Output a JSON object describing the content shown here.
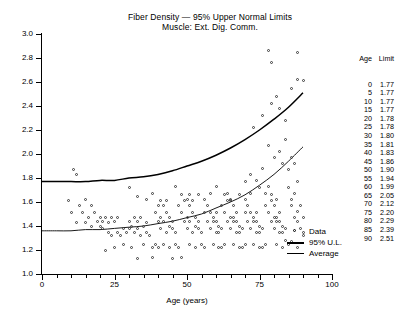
{
  "chart_data": {
    "type": "scatter",
    "title": "Fiber Density — 95% Upper Normal Limits",
    "subtitle": "Muscle: Ext. Dig. Comm.",
    "xlabel": "Age (years)",
    "ylabel": "",
    "xlim": [
      0,
      100
    ],
    "ylim": [
      1.0,
      3.0
    ],
    "xticks": [
      0,
      25,
      50,
      75,
      100
    ],
    "xtick_minor_step": 5,
    "yticks": [
      1.0,
      1.2,
      1.4,
      1.6,
      1.8,
      2.0,
      2.2,
      2.4,
      2.6,
      2.8,
      3.0
    ],
    "grid": false,
    "legend_position": "inside-bottom-right",
    "legend": [
      {
        "label": "Data",
        "marker": "open-circle"
      },
      {
        "label": "95% U.L.",
        "marker": "thick-line"
      },
      {
        "label": "Average",
        "marker": "thin-line"
      }
    ],
    "series": [
      {
        "name": "95% U.L.",
        "type": "line",
        "x": [
          0,
          5,
          10,
          15,
          20,
          25,
          30,
          35,
          40,
          45,
          50,
          55,
          60,
          65,
          70,
          75,
          80,
          85,
          90
        ],
        "values": [
          1.77,
          1.77,
          1.77,
          1.77,
          1.78,
          1.78,
          1.8,
          1.81,
          1.83,
          1.86,
          1.9,
          1.94,
          1.99,
          2.05,
          2.12,
          2.2,
          2.29,
          2.39,
          2.51
        ]
      },
      {
        "name": "Average",
        "type": "line",
        "x": [
          0,
          5,
          10,
          15,
          20,
          25,
          30,
          35,
          40,
          45,
          50,
          55,
          60,
          65,
          70,
          75,
          80,
          85,
          90
        ],
        "values": [
          1.36,
          1.36,
          1.36,
          1.37,
          1.37,
          1.38,
          1.39,
          1.4,
          1.42,
          1.44,
          1.47,
          1.5,
          1.55,
          1.6,
          1.66,
          1.74,
          1.83,
          1.94,
          2.06
        ]
      },
      {
        "name": "Data",
        "type": "scatter",
        "points": [
          [
            11,
            1.87
          ],
          [
            12,
            1.83
          ],
          [
            9,
            1.61
          ],
          [
            13,
            1.57
          ],
          [
            15,
            1.62
          ],
          [
            17,
            1.57
          ],
          [
            10,
            1.51
          ],
          [
            14,
            1.51
          ],
          [
            18,
            1.51
          ],
          [
            20,
            1.47
          ],
          [
            16,
            1.47
          ],
          [
            19,
            1.44
          ],
          [
            21,
            1.44
          ],
          [
            22,
            1.47
          ],
          [
            12,
            1.43
          ],
          [
            15,
            1.43
          ],
          [
            17,
            1.4
          ],
          [
            20,
            1.4
          ],
          [
            23,
            1.43
          ],
          [
            24,
            1.47
          ],
          [
            25,
            1.44
          ],
          [
            26,
            1.47
          ],
          [
            21,
            1.38
          ],
          [
            23,
            1.35
          ],
          [
            26,
            1.35
          ],
          [
            28,
            1.38
          ],
          [
            24,
            1.32
          ],
          [
            27,
            1.32
          ],
          [
            29,
            1.35
          ],
          [
            30,
            1.38
          ],
          [
            22,
            1.2
          ],
          [
            25,
            1.22
          ],
          [
            28,
            1.25
          ],
          [
            31,
            1.22
          ],
          [
            30,
            1.44
          ],
          [
            32,
            1.47
          ],
          [
            33,
            1.44
          ],
          [
            34,
            1.47
          ],
          [
            31,
            1.4
          ],
          [
            33,
            1.38
          ],
          [
            35,
            1.4
          ],
          [
            36,
            1.43
          ],
          [
            32,
            1.35
          ],
          [
            34,
            1.32
          ],
          [
            36,
            1.35
          ],
          [
            37,
            1.32
          ],
          [
            35,
            1.25
          ],
          [
            38,
            1.22
          ],
          [
            39,
            1.25
          ],
          [
            40,
            1.22
          ],
          [
            33,
            1.13
          ],
          [
            38,
            1.14
          ],
          [
            30,
            1.72
          ],
          [
            33,
            1.65
          ],
          [
            36,
            1.62
          ],
          [
            38,
            1.67
          ],
          [
            40,
            1.57
          ],
          [
            41,
            1.61
          ],
          [
            42,
            1.57
          ],
          [
            43,
            1.61
          ],
          [
            39,
            1.51
          ],
          [
            41,
            1.47
          ],
          [
            43,
            1.51
          ],
          [
            44,
            1.47
          ],
          [
            40,
            1.44
          ],
          [
            42,
            1.44
          ],
          [
            44,
            1.4
          ],
          [
            45,
            1.44
          ],
          [
            41,
            1.38
          ],
          [
            43,
            1.35
          ],
          [
            45,
            1.38
          ],
          [
            46,
            1.35
          ],
          [
            42,
            1.25
          ],
          [
            44,
            1.22
          ],
          [
            46,
            1.25
          ],
          [
            47,
            1.22
          ],
          [
            45,
            1.13
          ],
          [
            48,
            1.14
          ],
          [
            46,
            1.73
          ],
          [
            48,
            1.66
          ],
          [
            50,
            1.62
          ],
          [
            51,
            1.66
          ],
          [
            47,
            1.57
          ],
          [
            49,
            1.61
          ],
          [
            51,
            1.57
          ],
          [
            52,
            1.61
          ],
          [
            48,
            1.51
          ],
          [
            50,
            1.47
          ],
          [
            52,
            1.51
          ],
          [
            53,
            1.47
          ],
          [
            49,
            1.44
          ],
          [
            51,
            1.44
          ],
          [
            53,
            1.4
          ],
          [
            54,
            1.44
          ],
          [
            50,
            1.38
          ],
          [
            52,
            1.35
          ],
          [
            54,
            1.38
          ],
          [
            55,
            1.35
          ],
          [
            51,
            1.25
          ],
          [
            53,
            1.22
          ],
          [
            55,
            1.25
          ],
          [
            56,
            1.22
          ],
          [
            54,
            1.66
          ],
          [
            56,
            1.62
          ],
          [
            58,
            1.67
          ],
          [
            57,
            1.57
          ],
          [
            56,
            1.51
          ],
          [
            58,
            1.51
          ],
          [
            59,
            1.47
          ],
          [
            60,
            1.51
          ],
          [
            57,
            1.44
          ],
          [
            59,
            1.44
          ],
          [
            61,
            1.4
          ],
          [
            60,
            1.44
          ],
          [
            58,
            1.38
          ],
          [
            60,
            1.35
          ],
          [
            62,
            1.38
          ],
          [
            61,
            1.35
          ],
          [
            59,
            1.25
          ],
          [
            61,
            1.22
          ],
          [
            63,
            1.25
          ],
          [
            62,
            1.22
          ],
          [
            60,
            1.73
          ],
          [
            63,
            1.66
          ],
          [
            65,
            1.62
          ],
          [
            64,
            1.67
          ],
          [
            62,
            1.57
          ],
          [
            64,
            1.61
          ],
          [
            66,
            1.57
          ],
          [
            65,
            1.61
          ],
          [
            63,
            1.51
          ],
          [
            65,
            1.47
          ],
          [
            67,
            1.51
          ],
          [
            66,
            1.47
          ],
          [
            64,
            1.44
          ],
          [
            66,
            1.44
          ],
          [
            68,
            1.4
          ],
          [
            67,
            1.44
          ],
          [
            65,
            1.38
          ],
          [
            67,
            1.35
          ],
          [
            69,
            1.38
          ],
          [
            68,
            1.35
          ],
          [
            66,
            1.25
          ],
          [
            68,
            1.22
          ],
          [
            70,
            1.25
          ],
          [
            69,
            1.22
          ],
          [
            68,
            1.66
          ],
          [
            70,
            1.62
          ],
          [
            72,
            1.67
          ],
          [
            71,
            1.57
          ],
          [
            70,
            1.51
          ],
          [
            72,
            1.51
          ],
          [
            73,
            1.47
          ],
          [
            74,
            1.51
          ],
          [
            71,
            1.44
          ],
          [
            73,
            1.44
          ],
          [
            75,
            1.4
          ],
          [
            74,
            1.44
          ],
          [
            72,
            1.38
          ],
          [
            74,
            1.35
          ],
          [
            76,
            1.38
          ],
          [
            75,
            1.35
          ],
          [
            73,
            1.25
          ],
          [
            75,
            1.22
          ],
          [
            77,
            1.25
          ],
          [
            76,
            1.22
          ],
          [
            70,
            1.77
          ],
          [
            72,
            1.83
          ],
          [
            74,
            1.78
          ],
          [
            76,
            1.88
          ],
          [
            75,
            1.72
          ],
          [
            77,
            1.67
          ],
          [
            78,
            1.73
          ],
          [
            79,
            1.66
          ],
          [
            77,
            1.57
          ],
          [
            79,
            1.61
          ],
          [
            80,
            1.57
          ],
          [
            81,
            1.62
          ],
          [
            78,
            1.51
          ],
          [
            80,
            1.47
          ],
          [
            82,
            1.51
          ],
          [
            81,
            1.47
          ],
          [
            79,
            1.44
          ],
          [
            81,
            1.44
          ],
          [
            83,
            1.4
          ],
          [
            82,
            1.44
          ],
          [
            80,
            1.38
          ],
          [
            82,
            1.35
          ],
          [
            84,
            1.38
          ],
          [
            83,
            1.35
          ],
          [
            81,
            1.25
          ],
          [
            83,
            1.22
          ],
          [
            85,
            1.25
          ],
          [
            84,
            1.28
          ],
          [
            78,
            2.07
          ],
          [
            80,
            1.97
          ],
          [
            82,
            2.02
          ],
          [
            84,
            2.12
          ],
          [
            83,
            1.92
          ],
          [
            85,
            1.87
          ],
          [
            86,
            1.97
          ],
          [
            87,
            1.92
          ],
          [
            85,
            1.72
          ],
          [
            87,
            1.67
          ],
          [
            88,
            1.77
          ],
          [
            86,
            1.62
          ],
          [
            86,
            1.57
          ],
          [
            88,
            1.52
          ],
          [
            89,
            1.57
          ],
          [
            87,
            1.47
          ],
          [
            88,
            1.44
          ],
          [
            90,
            1.47
          ],
          [
            89,
            1.38
          ],
          [
            90,
            1.35
          ],
          [
            86,
            1.27
          ],
          [
            88,
            1.22
          ],
          [
            90,
            1.32
          ],
          [
            78,
            2.86
          ],
          [
            79,
            2.76
          ],
          [
            88,
            2.85
          ],
          [
            88,
            2.62
          ],
          [
            82,
            2.38
          ],
          [
            84,
            2.28
          ],
          [
            86,
            2.55
          ],
          [
            90,
            2.61
          ],
          [
            73,
            2.22
          ],
          [
            76,
            2.32
          ],
          [
            79,
            2.42
          ],
          [
            81,
            2.48
          ]
        ]
      }
    ],
    "reference_table": {
      "headers": [
        "Age",
        "Limit"
      ],
      "rows": [
        [
          "0",
          "1.77"
        ],
        [
          "5",
          "1.77"
        ],
        [
          "10",
          "1.77"
        ],
        [
          "15",
          "1.77"
        ],
        [
          "20",
          "1.78"
        ],
        [
          "25",
          "1.78"
        ],
        [
          "30",
          "1.80"
        ],
        [
          "35",
          "1.81"
        ],
        [
          "40",
          "1.83"
        ],
        [
          "45",
          "1.86"
        ],
        [
          "50",
          "1.90"
        ],
        [
          "55",
          "1.94"
        ],
        [
          "60",
          "1.99"
        ],
        [
          "65",
          "2.05"
        ],
        [
          "70",
          "2.12"
        ],
        [
          "75",
          "2.20"
        ],
        [
          "80",
          "2.29"
        ],
        [
          "85",
          "2.39"
        ],
        [
          "90",
          "2.51"
        ]
      ]
    }
  }
}
